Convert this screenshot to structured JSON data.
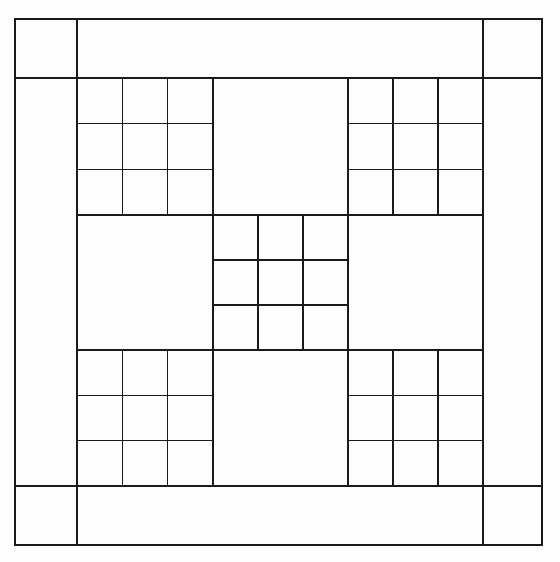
{
  "figure": {
    "type": "line-diagram",
    "width": 560,
    "height": 562,
    "background_color": "#fdfdfd",
    "line_color": "#1a1a1a",
    "line_width_thin": 1.4,
    "line_width_thick": 2.0
  },
  "layout": {
    "outer_frame": {
      "x": 15,
      "y": 19,
      "width": 527,
      "height": 526
    },
    "border_band": {
      "left": 77,
      "top": 78,
      "right": 483,
      "bottom": 486
    },
    "corner_square_size": 62,
    "columns_x": [
      15,
      77,
      213,
      348,
      483,
      542
    ],
    "rows_y": [
      19,
      78,
      215,
      350,
      486,
      545
    ]
  },
  "blocks": [
    {
      "id": "top-left",
      "kind": "nine-patch",
      "row": 0,
      "col": 0,
      "x": 77,
      "y": 78,
      "width": 136,
      "height": 137
    },
    {
      "id": "top-center",
      "kind": "plain",
      "row": 0,
      "col": 1,
      "x": 213,
      "y": 78,
      "width": 135,
      "height": 137
    },
    {
      "id": "top-right",
      "kind": "nine-patch",
      "row": 0,
      "col": 2,
      "x": 348,
      "y": 78,
      "width": 135,
      "height": 137
    },
    {
      "id": "middle-left",
      "kind": "plain",
      "row": 1,
      "col": 0,
      "x": 77,
      "y": 215,
      "width": 136,
      "height": 135
    },
    {
      "id": "center",
      "kind": "nine-patch",
      "row": 1,
      "col": 1,
      "x": 213,
      "y": 215,
      "width": 135,
      "height": 135
    },
    {
      "id": "middle-right",
      "kind": "plain",
      "row": 1,
      "col": 2,
      "x": 348,
      "y": 215,
      "width": 135,
      "height": 135
    },
    {
      "id": "bottom-left",
      "kind": "nine-patch",
      "row": 2,
      "col": 0,
      "x": 77,
      "y": 350,
      "width": 136,
      "height": 136
    },
    {
      "id": "bottom-center",
      "kind": "plain",
      "row": 2,
      "col": 1,
      "x": 213,
      "y": 350,
      "width": 135,
      "height": 136
    },
    {
      "id": "bottom-right",
      "kind": "nine-patch",
      "row": 2,
      "col": 2,
      "x": 348,
      "y": 350,
      "width": 135,
      "height": 136
    }
  ],
  "corner_squares": [
    {
      "id": "corner-top-left",
      "x": 15,
      "y": 19,
      "width": 62,
      "height": 59
    },
    {
      "id": "corner-top-right",
      "x": 483,
      "y": 19,
      "width": 59,
      "height": 59
    },
    {
      "id": "corner-bottom-left",
      "x": 15,
      "y": 486,
      "width": 62,
      "height": 59
    },
    {
      "id": "corner-bottom-right",
      "x": 483,
      "y": 486,
      "width": 59,
      "height": 59
    }
  ],
  "counts": {
    "nine_patch_blocks": 5,
    "plain_blocks": 4,
    "small_squares_per_patch": 9,
    "total_small_squares": 45,
    "corner_squares": 4
  }
}
